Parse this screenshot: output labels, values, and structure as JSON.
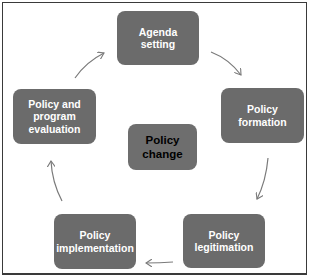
{
  "diagram": {
    "type": "cycle",
    "center": {
      "label": "Policy\nchange"
    },
    "nodes": [
      {
        "id": "agenda-setting",
        "label": "Agenda setting"
      },
      {
        "id": "policy-formation",
        "label": "Policy formation"
      },
      {
        "id": "policy-legitimation",
        "label": "Policy\nlegitimation"
      },
      {
        "id": "policy-implementation",
        "label": "Policy\nimplementation"
      },
      {
        "id": "policy-evaluation",
        "label": "Policy and\nprogram\nevaluation"
      }
    ],
    "edges": [
      {
        "from": "agenda-setting",
        "to": "policy-formation"
      },
      {
        "from": "policy-formation",
        "to": "policy-legitimation"
      },
      {
        "from": "policy-legitimation",
        "to": "policy-implementation"
      },
      {
        "from": "policy-implementation",
        "to": "policy-evaluation"
      },
      {
        "from": "policy-evaluation",
        "to": "agenda-setting"
      }
    ],
    "colors": {
      "node_fill": "#6b6b6b",
      "node_text": "#ffffff",
      "center_text": "#000000",
      "arrow": "#7a7a7a",
      "frame": "#3a3a3a"
    }
  }
}
